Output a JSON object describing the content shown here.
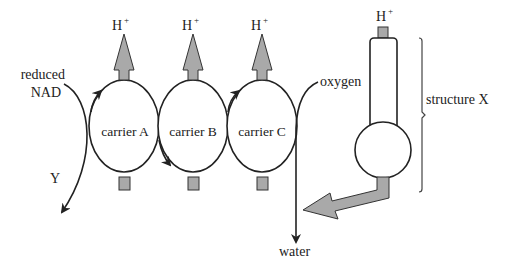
{
  "diagram": {
    "labels": {
      "reduced_nad_line1": "reduced",
      "reduced_nad_line2": "NAD",
      "y": "Y",
      "carrier_a": "carrier A",
      "carrier_b": "carrier B",
      "carrier_c": "carrier C",
      "h_plus_a": "H",
      "h_plus_b": "H",
      "h_plus_c": "H",
      "h_plus_x": "H",
      "plus": "+",
      "oxygen": "oxygen",
      "water": "water",
      "structure_x": "structure X"
    },
    "colors": {
      "line": "#222222",
      "fill_grey": "#a9a9a9",
      "background": "#ffffff"
    }
  }
}
